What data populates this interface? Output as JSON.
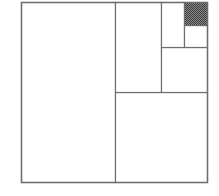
{
  "diagram": {
    "colors": {
      "line": "#6e6e6e",
      "shade": "#555555",
      "background": "#ffffff"
    },
    "outer": {
      "x": 21,
      "y": 2,
      "w": 186,
      "h": 180
    },
    "regions": [
      {
        "name": "region-half",
        "x": 21,
        "y": 2,
        "w": 94,
        "h": 180,
        "shaded": false
      },
      {
        "name": "region-quarter",
        "x": 115,
        "y": 92,
        "w": 92,
        "h": 90,
        "shaded": false
      },
      {
        "name": "region-eighth",
        "x": 115,
        "y": 2,
        "w": 46,
        "h": 90,
        "shaded": false
      },
      {
        "name": "region-sixteenth",
        "x": 161,
        "y": 47,
        "w": 46,
        "h": 45,
        "shaded": false
      },
      {
        "name": "region-thirty-second",
        "x": 161,
        "y": 2,
        "w": 23,
        "h": 45,
        "shaded": false
      },
      {
        "name": "region-sixty-fourth",
        "x": 184,
        "y": 25,
        "w": 23,
        "h": 22,
        "shaded": false
      },
      {
        "name": "region-remainder",
        "x": 184,
        "y": 2,
        "w": 23,
        "h": 23,
        "shaded": true
      }
    ]
  }
}
